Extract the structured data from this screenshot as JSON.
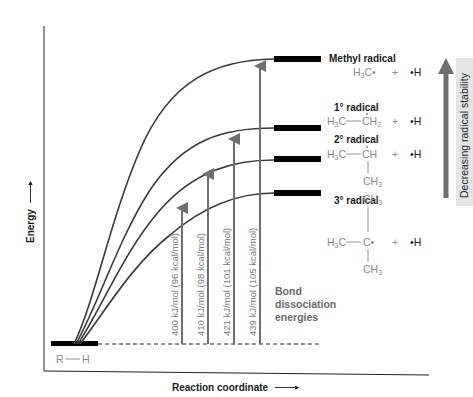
{
  "axes": {
    "y_label": "Energy",
    "x_label": "Reaction coordinate"
  },
  "reactant": {
    "label_r": "R",
    "label_h": "H"
  },
  "levels": [
    {
      "id": "methyl",
      "title": "Methyl radical",
      "formula_main": "H3C•",
      "plus": "+",
      "h_radical": "•H"
    },
    {
      "id": "primary",
      "title": "1° radical",
      "left": "H3C",
      "right": "CH2",
      "plus": "+",
      "h_radical": "•H"
    },
    {
      "id": "secondary",
      "title": "2° radical",
      "left": "H3C",
      "right": "CH",
      "below": "CH3",
      "plus": "+",
      "h_radical": "•H"
    },
    {
      "id": "tertiary",
      "title": "3° radical",
      "above": "CH3",
      "left": "H3C",
      "center": "C•",
      "below": "CH3",
      "plus": "+",
      "h_radical": "•H"
    }
  ],
  "bde_arrows": [
    {
      "label": "400 kJ/mol (96 kcal/mol)",
      "radical": "3°"
    },
    {
      "label": "410 kJ/mol (98 kcal/mol)",
      "radical": "2°"
    },
    {
      "label": "421 kJ/mol (101 kcal/mol)",
      "radical": "1°"
    },
    {
      "label": "439 kJ/mol (105 kcal/mol)",
      "radical": "methyl"
    }
  ],
  "bde_title": [
    "Bond",
    "dissociation",
    "energies"
  ],
  "stability_arrow": {
    "label": "Decreasing radical stability"
  },
  "colors": {
    "curve": "#3a3a3a",
    "arrow": "#6e6e6e",
    "level_bar": "#000000",
    "chem_text": "#8a8a8a",
    "stability_bg": "#e4e4e4"
  }
}
